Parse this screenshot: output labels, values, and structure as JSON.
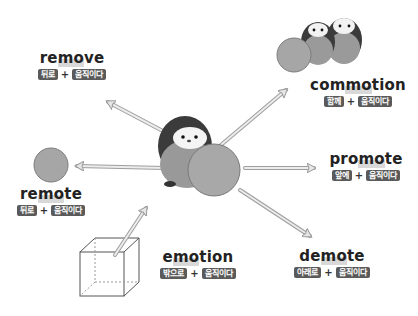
{
  "diagram": {
    "root_meaning": "움직이다",
    "center": "penguin-pushing-ball",
    "words": [
      {
        "id": "remove",
        "pre": "re",
        "root": "mo",
        "post": "ve",
        "prefix_meaning": "뒤로",
        "root_meaning": "움직이다",
        "direction": "up-left"
      },
      {
        "id": "commotion",
        "pre": "com",
        "root": "mo",
        "post": "tion",
        "prefix_meaning": "함께",
        "root_meaning": "움직이다",
        "direction": "up-right"
      },
      {
        "id": "remote",
        "pre": "re",
        "root": "mo",
        "post": "te",
        "prefix_meaning": "뒤로",
        "root_meaning": "움직이다",
        "direction": "left"
      },
      {
        "id": "promote",
        "pre": "pro",
        "root": "mo",
        "post": "te",
        "prefix_meaning": "앞에",
        "root_meaning": "움직이다",
        "direction": "right"
      },
      {
        "id": "emotion",
        "pre": "e",
        "root": "mo",
        "post": "tion",
        "prefix_meaning": "밖으로",
        "root_meaning": "움직이다",
        "direction": "out-of-box"
      },
      {
        "id": "demote",
        "pre": "de",
        "root": "mo",
        "post": "te",
        "prefix_meaning": "아래로",
        "root_meaning": "움직이다",
        "direction": "down-right"
      }
    ],
    "plus_sign": "+",
    "colors": {
      "tag_bg": "#5a5a5a",
      "tag_text": "#ffffff",
      "word_text": "#222222",
      "highlight": "#d8d8d8",
      "arrow": "#bdbdbd",
      "ball": "#a9a9a9",
      "penguin_dark": "#3a3a3a",
      "penguin_body": "#9a9a9a"
    }
  }
}
